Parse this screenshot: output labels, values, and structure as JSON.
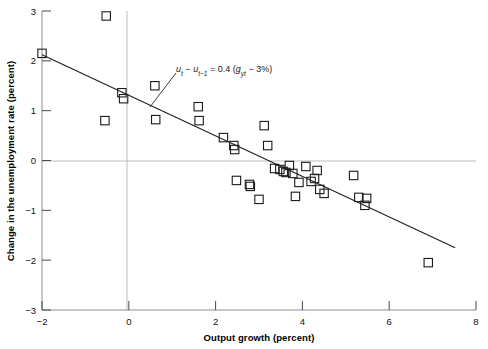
{
  "chart_data": {
    "type": "scatter",
    "title": "",
    "xlabel": "Output growth (percent)",
    "ylabel": "Change in the unemployment rate (percent)",
    "xlim": [
      -2,
      8
    ],
    "ylim": [
      -3,
      3
    ],
    "xticks": [
      -2,
      0,
      2,
      4,
      6,
      8
    ],
    "xticklabels": [
      "−2",
      "0",
      "2",
      "4",
      "6",
      "8"
    ],
    "yticks": [
      -3,
      -2,
      -1,
      0,
      1,
      2,
      3
    ],
    "yticklabels": [
      "−3",
      "−2",
      "−1",
      "0",
      "1",
      "2",
      "3"
    ],
    "grid": false,
    "zero_line_y": 0,
    "zero_line_x": 0,
    "legend": null,
    "marker": "open-square",
    "points": [
      {
        "x": -2.0,
        "y": 2.15
      },
      {
        "x": -0.52,
        "y": 2.9
      },
      {
        "x": -0.55,
        "y": 0.8
      },
      {
        "x": -0.16,
        "y": 1.36
      },
      {
        "x": -0.12,
        "y": 1.24
      },
      {
        "x": 0.62,
        "y": 0.82
      },
      {
        "x": 0.6,
        "y": 1.5
      },
      {
        "x": 1.6,
        "y": 1.08
      },
      {
        "x": 1.62,
        "y": 0.8
      },
      {
        "x": 2.18,
        "y": 0.46
      },
      {
        "x": 2.42,
        "y": 0.3
      },
      {
        "x": 2.44,
        "y": 0.22
      },
      {
        "x": 2.48,
        "y": -0.4
      },
      {
        "x": 2.78,
        "y": -0.48
      },
      {
        "x": 2.8,
        "y": -0.52
      },
      {
        "x": 3.0,
        "y": -0.78
      },
      {
        "x": 3.12,
        "y": 0.7
      },
      {
        "x": 3.2,
        "y": 0.3
      },
      {
        "x": 3.36,
        "y": -0.16
      },
      {
        "x": 3.48,
        "y": -0.18
      },
      {
        "x": 3.56,
        "y": -0.22
      },
      {
        "x": 3.62,
        "y": -0.24
      },
      {
        "x": 3.7,
        "y": -0.1
      },
      {
        "x": 3.78,
        "y": -0.26
      },
      {
        "x": 3.84,
        "y": -0.72
      },
      {
        "x": 3.92,
        "y": -0.44
      },
      {
        "x": 4.08,
        "y": -0.12
      },
      {
        "x": 4.2,
        "y": -0.42
      },
      {
        "x": 4.28,
        "y": -0.36
      },
      {
        "x": 4.34,
        "y": -0.2
      },
      {
        "x": 4.4,
        "y": -0.58
      },
      {
        "x": 4.5,
        "y": -0.66
      },
      {
        "x": 5.18,
        "y": -0.3
      },
      {
        "x": 5.3,
        "y": -0.74
      },
      {
        "x": 5.48,
        "y": -0.76
      },
      {
        "x": 5.44,
        "y": -0.9
      },
      {
        "x": 6.9,
        "y": -2.05
      }
    ],
    "fit_line": {
      "x_start": -2.0,
      "y_start": 2.12,
      "x_end": 7.52,
      "y_end": -1.75
    },
    "annotation": {
      "prefix": "u",
      "sub1": "t",
      "dash1": " − ",
      "var2": "u",
      "sub2": "t−1",
      "equals": " = 0.4 (",
      "var3": "g",
      "sub3": "yt",
      "tail": " − 3%)",
      "full": "u_t − u_t−1 = 0.4 (g_yt − 3%)",
      "leader_from_x": 176,
      "leader_from_y": 73,
      "leader_to_x": 150,
      "leader_to_y": 107
    }
  }
}
